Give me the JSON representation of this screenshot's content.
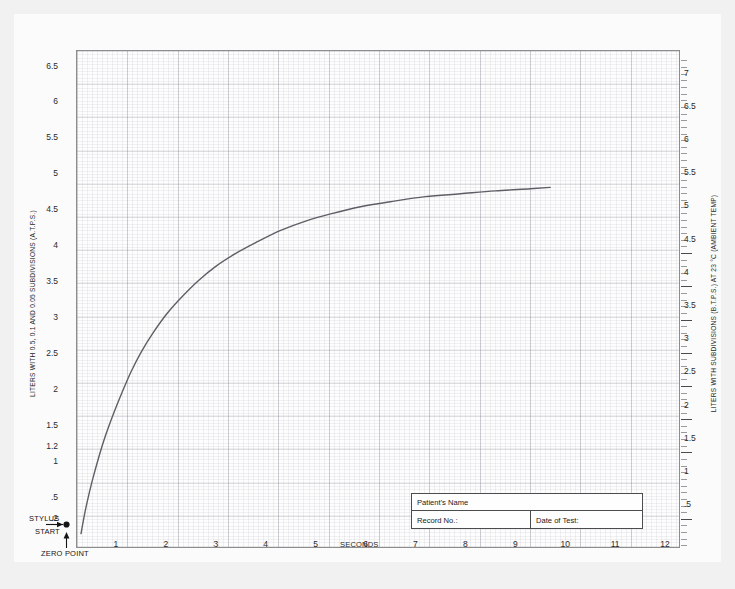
{
  "chart_data": {
    "type": "line",
    "title": "",
    "xlabel": "SECONDS",
    "ylabel": "LITERS WITH 0.5, 0.1 AND 0.05 SUBDIVISIONS (A.T.P.S.)",
    "y2label": "LITERS WITH SUBDIVISIONS (B.T.P.S.) AT 23 °C (AMBIENT TEMP)",
    "xlim": [
      0,
      12
    ],
    "ylim": [
      0,
      6.9
    ],
    "y2lim": [
      0,
      7.4
    ],
    "grid": true,
    "legend": "none",
    "x_ticks": [
      "1",
      "2",
      "3",
      "4",
      "5",
      "6",
      "7",
      "8",
      "9",
      "10",
      "11",
      "12"
    ],
    "y_ticks": [
      "6.5",
      "6",
      "5.5",
      "5",
      "4.5",
      "4",
      "3.5",
      "3",
      "2.5",
      "2",
      "1.5",
      "1.2",
      "1",
      ".5",
      ".2"
    ],
    "y2_ticks": [
      "7",
      "6.5",
      "6",
      "5.5",
      "5",
      "4.5",
      "4",
      "3.5",
      "3",
      "2.5",
      "2",
      "1.5",
      "1",
      ".5"
    ],
    "series": [
      {
        "name": "Spirogram volume-time curve",
        "x": [
          0.0,
          0.08,
          0.17,
          0.25,
          0.35,
          0.45,
          0.55,
          0.68,
          0.82,
          1.0,
          1.2,
          1.45,
          1.72,
          2.0,
          2.35,
          2.7,
          3.1,
          3.5,
          4.0,
          4.5,
          5.0,
          5.6,
          6.2,
          6.9,
          7.6,
          8.3,
          9.0,
          9.4
        ],
        "y": [
          0.2,
          0.5,
          0.78,
          1.0,
          1.25,
          1.48,
          1.68,
          1.92,
          2.16,
          2.45,
          2.72,
          3.0,
          3.26,
          3.48,
          3.72,
          3.92,
          4.1,
          4.25,
          4.42,
          4.55,
          4.65,
          4.75,
          4.82,
          4.89,
          4.93,
          4.97,
          5.0,
          5.02
        ]
      }
    ],
    "annotations": [
      {
        "name": "stylus-start",
        "line1": "STYLUS",
        "line2": "START",
        "value": ".2"
      },
      {
        "name": "zero-point",
        "text": "ZERO POINT"
      }
    ]
  },
  "axes": {
    "x_label": "SECONDS",
    "left_title": "LITERS WITH 0.5, 0.1 AND 0.05 SUBDIVISIONS (A.T.P.S.)",
    "right_title": "LITERS WITH SUBDIVISIONS (B.T.P.S.) AT 23 °C (AMBIENT TEMP)"
  },
  "annotations": {
    "stylus": "STYLUS",
    "start": "START",
    "zero_point": "ZERO POINT"
  },
  "form": {
    "patient_name_label": "Patient's Name",
    "record_no_label": "Record No.:",
    "date_of_test_label": "Date of Test:",
    "patient_name_value": "",
    "record_no_value": "",
    "date_of_test_value": ""
  },
  "colors": {
    "curve": "#5e5e66",
    "grid_major": "#78788733",
    "paper": "#fbfbfb",
    "frame": "#8d8d8d"
  }
}
